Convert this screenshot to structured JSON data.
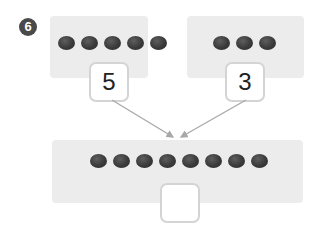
{
  "problem": {
    "number": "6",
    "left_group": {
      "count": 5,
      "label": "5"
    },
    "right_group": {
      "count": 3,
      "label": "3"
    },
    "combined_group": {
      "count": 8,
      "answer": ""
    }
  },
  "colors": {
    "panel_bg": "#ececec",
    "dot": "#3a3a3a",
    "badge": "#4a4a4a",
    "arrow": "#a8a8a8",
    "box_border": "#d4d4d4"
  }
}
